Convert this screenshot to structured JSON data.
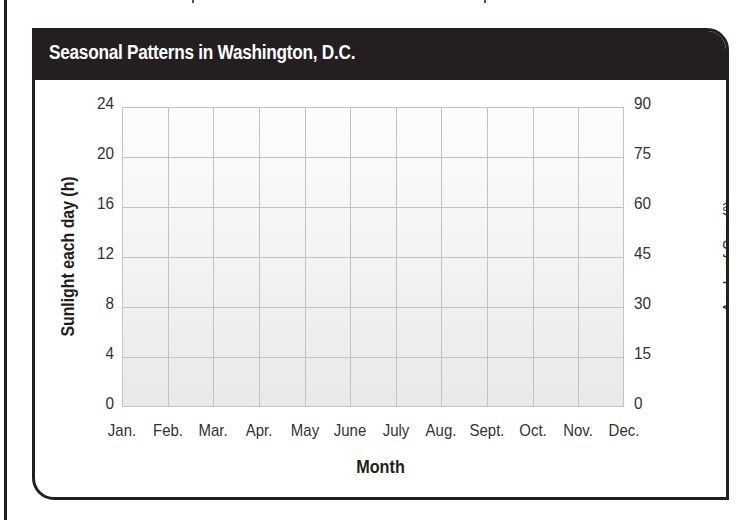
{
  "figure": {
    "title": "Seasonal Patterns in Washington, D.C.",
    "colors": {
      "header_bg": "#231f20",
      "header_text": "#ffffff",
      "grid_line": "#c2c2c2",
      "plot_bg_top": "#fdfdfd",
      "plot_bg_bottom": "#e9e9e9",
      "border": "#231f20"
    }
  },
  "chart_data": {
    "type": "line",
    "title": "Seasonal Patterns in Washington, D.C.",
    "xlabel": "Month",
    "ylabel": "Sunlight each day (h)",
    "y2label": "Angle of Sun (°)",
    "categories": [
      "Jan.",
      "Feb.",
      "Mar.",
      "Apr.",
      "May",
      "June",
      "July",
      "Aug.",
      "Sept.",
      "Oct.",
      "Nov.",
      "Dec."
    ],
    "series": [],
    "ylim": [
      0,
      24
    ],
    "y2lim": [
      0,
      90
    ],
    "yticks": [
      "24",
      "20",
      "16",
      "12",
      "8",
      "4",
      "0"
    ],
    "y2ticks": [
      "90",
      "75",
      "60",
      "45",
      "30",
      "15",
      "0"
    ],
    "grid": true,
    "grid_rows": 6,
    "grid_cols": 11,
    "legend": null,
    "note": "Blank graph template; no data plotted"
  }
}
